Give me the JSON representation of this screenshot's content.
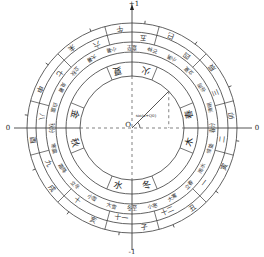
{
  "diagram": {
    "center": [
      132,
      128
    ],
    "axis_labels": {
      "top": "+1",
      "bottom": "-1",
      "left": "0",
      "right": "0",
      "origin": "O",
      "radius_label": "sin(x+Q0)"
    },
    "outer_ring_branches": [
      "子",
      "丑",
      "寅",
      "卯",
      "辰",
      "巳",
      "午",
      "未",
      "申",
      "酉",
      "戌",
      "亥"
    ],
    "outer_ring_months": [
      "十一",
      "十二",
      "一",
      "二",
      "三",
      "四",
      "五",
      "六",
      "七",
      "八",
      "九",
      "十"
    ],
    "solar_terms": [
      "冬至",
      "小寒",
      "大寒",
      "立春",
      "雨水",
      "惊蛰",
      "春分",
      "清明",
      "谷雨",
      "立夏",
      "小满",
      "芒种",
      "夏至",
      "小暑",
      "大暑",
      "立秋",
      "处暑",
      "白露",
      "秋分",
      "寒露",
      "霜降",
      "立冬",
      "小雪",
      "大雪"
    ],
    "inner_ring": [
      {
        "season": "冬",
        "element": "水"
      },
      {
        "season": "春",
        "element": "木"
      },
      {
        "season": "夏",
        "element": "火"
      },
      {
        "season": "秋",
        "element": "金"
      }
    ],
    "colors": {
      "line": "#3a3a3a",
      "text": "#333333",
      "background": "#ffffff"
    }
  }
}
